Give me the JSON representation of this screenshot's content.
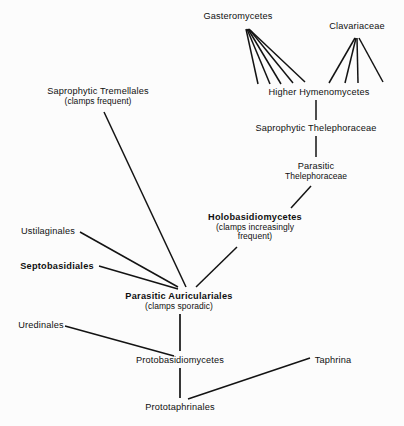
{
  "figure": {
    "background_color": "#fcfcfc",
    "line_color": "#131313",
    "text_color": "#101010"
  },
  "nodes": [
    {
      "id": "gasteromycetes",
      "label": "Gasteromycetes",
      "sub": "",
      "sub2": "",
      "bold": false,
      "cx": 238,
      "top": 11
    },
    {
      "id": "clavariaceae",
      "label": "Clavariaceae",
      "sub": "",
      "sub2": "",
      "bold": false,
      "cx": 357,
      "top": 21
    },
    {
      "id": "higher-hymenomycetes",
      "label": "Higher Hymenomycetes",
      "sub": "",
      "sub2": "",
      "bold": false,
      "cx": 319,
      "top": 87
    },
    {
      "id": "saprophytic-thelephoraceae",
      "label": "Saprophytic Thelephoraceae",
      "sub": "",
      "sub2": "",
      "bold": false,
      "cx": 316,
      "top": 123
    },
    {
      "id": "parasitic-thelephoraceae",
      "label": "Parasitic",
      "sub": "Thelephoraceae",
      "sub2": "",
      "bold": false,
      "cx": 316,
      "top": 161
    },
    {
      "id": "saprophytic-tremellales",
      "label": "Saprophytic Tremellales",
      "sub": "(clamps frequent)",
      "sub2": "",
      "bold": false,
      "cx": 98,
      "top": 86
    },
    {
      "id": "holobasidiomycetes",
      "label": "Holobasidiomycetes",
      "sub": "(clamps increasingly",
      "sub2": "frequent)",
      "bold": true,
      "cx": 255,
      "top": 212
    },
    {
      "id": "ustilaginales",
      "label": "Ustilaginales",
      "sub": "",
      "sub2": "",
      "bold": false,
      "cx": 48,
      "top": 226
    },
    {
      "id": "septobasidiales",
      "label": "Septobasidiales",
      "sub": "",
      "sub2": "",
      "bold": true,
      "cx": 57,
      "top": 261
    },
    {
      "id": "parasitic-auriculariales",
      "label": "Parasitic  Auriculariales",
      "sub": "(clamps sporadic)",
      "sub2": "",
      "bold": true,
      "cx": 179,
      "top": 291
    },
    {
      "id": "uredinales",
      "label": "Uredinales",
      "sub": "",
      "sub2": "",
      "bold": false,
      "cx": 41,
      "top": 320
    },
    {
      "id": "protobasidiomycetes",
      "label": "Protobasidiomycetes",
      "sub": "",
      "sub2": "",
      "bold": false,
      "cx": 180,
      "top": 355
    },
    {
      "id": "taphrina",
      "label": "Taphrina",
      "sub": "",
      "sub2": "",
      "bold": false,
      "cx": 333,
      "top": 355
    },
    {
      "id": "prototaphrinales",
      "label": "Prototaphrinales",
      "sub": "",
      "sub2": "",
      "bold": false,
      "cx": 180,
      "top": 402
    }
  ],
  "edges": [
    {
      "id": "gast-fan-1",
      "from": "higher-hymenomycetes",
      "to": "gasteromycetes",
      "x1": 258,
      "y1": 84,
      "x2": 246,
      "y2": 29,
      "w": 1.5
    },
    {
      "id": "gast-fan-2",
      "from": "higher-hymenomycetes",
      "to": "gasteromycetes",
      "x1": 270,
      "y1": 84,
      "x2": 247,
      "y2": 29,
      "w": 1.5
    },
    {
      "id": "gast-fan-3",
      "from": "higher-hymenomycetes",
      "to": "gasteromycetes",
      "x1": 281,
      "y1": 84,
      "x2": 248,
      "y2": 29,
      "w": 1.5
    },
    {
      "id": "gast-fan-4",
      "from": "higher-hymenomycetes",
      "to": "gasteromycetes",
      "x1": 293,
      "y1": 83,
      "x2": 249,
      "y2": 29,
      "w": 1.5
    },
    {
      "id": "gast-fan-5",
      "from": "higher-hymenomycetes",
      "to": "gasteromycetes",
      "x1": 305,
      "y1": 82,
      "x2": 250,
      "y2": 30,
      "w": 1.5
    },
    {
      "id": "clav-fan-1",
      "from": "higher-hymenomycetes",
      "to": "clavariaceae",
      "x1": 329,
      "y1": 83,
      "x2": 355,
      "y2": 38,
      "w": 1.5
    },
    {
      "id": "clav-fan-2",
      "from": "higher-hymenomycetes",
      "to": "clavariaceae",
      "x1": 345,
      "y1": 83,
      "x2": 356,
      "y2": 38,
      "w": 1.5
    },
    {
      "id": "clav-fan-3",
      "from": "higher-hymenomycetes",
      "to": "clavariaceae",
      "x1": 358,
      "y1": 83,
      "x2": 357,
      "y2": 38,
      "w": 1.5
    },
    {
      "id": "clav-fan-4",
      "from": "higher-hymenomycetes",
      "to": "clavariaceae",
      "x1": 383,
      "y1": 82,
      "x2": 359,
      "y2": 38,
      "w": 1.5
    },
    {
      "id": "sapro-thele-to-hh",
      "from": "saprophytic-thelephoraceae",
      "to": "higher-hymenomycetes",
      "x1": 316,
      "y1": 100,
      "x2": 316,
      "y2": 120,
      "w": 1.5
    },
    {
      "id": "para-thele-to-sapro",
      "from": "parasitic-thelephoraceae",
      "to": "saprophytic-thelephoraceae",
      "x1": 316,
      "y1": 136,
      "x2": 316,
      "y2": 157,
      "w": 1.5
    },
    {
      "id": "holo-to-para-thele",
      "from": "holobasidiomycetes",
      "to": "parasitic-thelephoraceae",
      "x1": 291,
      "y1": 208,
      "x2": 311,
      "y2": 186,
      "w": 1.5
    },
    {
      "id": "tremellales-to-auric",
      "from": "saprophytic-tremellales",
      "to": "parasitic-auriculariales",
      "x1": 186,
      "y1": 287,
      "x2": 104,
      "y2": 112,
      "w": 1.5
    },
    {
      "id": "holo-to-auric",
      "from": "holobasidiomycetes",
      "to": "parasitic-auriculariales",
      "x1": 196,
      "y1": 287,
      "x2": 237,
      "y2": 247,
      "w": 1.5
    },
    {
      "id": "ustilaginales-to-auric",
      "from": "ustilaginales",
      "to": "parasitic-auriculariales",
      "x1": 80,
      "y1": 232,
      "x2": 178,
      "y2": 287,
      "w": 1.5
    },
    {
      "id": "septobasidiales-to-auric",
      "from": "septobasidiales",
      "to": "parasitic-auriculariales",
      "x1": 99,
      "y1": 266,
      "x2": 178,
      "y2": 289,
      "w": 1.5
    },
    {
      "id": "auric-to-proto",
      "from": "parasitic-auriculariales",
      "to": "protobasidiomycetes",
      "x1": 180,
      "y1": 314,
      "x2": 180,
      "y2": 351,
      "w": 1.7
    },
    {
      "id": "uredinales-to-proto",
      "from": "uredinales",
      "to": "protobasidiomycetes",
      "x1": 65,
      "y1": 326,
      "x2": 174,
      "y2": 356,
      "w": 1.5
    },
    {
      "id": "proto-to-prototaph",
      "from": "protobasidiomycetes",
      "to": "prototaphrinales",
      "x1": 180,
      "y1": 368,
      "x2": 180,
      "y2": 398,
      "w": 1.7
    },
    {
      "id": "taphrina-to-prototaph",
      "from": "taphrina",
      "to": "prototaphrinales",
      "x1": 310,
      "y1": 358,
      "x2": 188,
      "y2": 399,
      "w": 1.5
    }
  ]
}
